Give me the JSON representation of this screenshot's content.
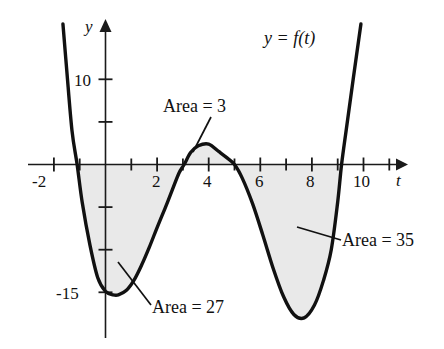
{
  "figure": {
    "function_label": "y = f(t)",
    "axis_labels": {
      "x": "t",
      "y": "y"
    },
    "colors": {
      "curve": "#111111",
      "axis": "#1a1a1a",
      "shade_fill": "#e9e9e9",
      "background": "#ffffff",
      "text": "#111111"
    }
  },
  "annotations": [
    {
      "id": "area-3",
      "label": "Area = 3",
      "value": 3,
      "interval": [
        3.05,
        5.0
      ],
      "sign": "positive"
    },
    {
      "id": "area-27",
      "label": "Area = 27",
      "value": 27,
      "interval": [
        -1.1,
        3.05
      ],
      "sign": "negative"
    },
    {
      "id": "area-35",
      "label": "Area = 35",
      "value": 35,
      "interval": [
        5.0,
        9.15
      ],
      "sign": "negative"
    }
  ],
  "chart_data": {
    "type": "line",
    "title": "y = f(t)",
    "xlabel": "t",
    "ylabel": "y",
    "xlim": [
      -2.9,
      11.5
    ],
    "ylim": [
      -20.5,
      16.5
    ],
    "grid": false,
    "legend": null,
    "x_ticks": [
      -2,
      -1,
      1,
      2,
      3,
      4,
      5,
      6,
      7,
      8,
      9,
      10,
      11
    ],
    "x_tick_labels": [
      "-2",
      "",
      "",
      "2",
      "",
      "4",
      "",
      "6",
      "",
      "8",
      "",
      "10",
      ""
    ],
    "y_ticks": [
      10,
      5,
      -5,
      -10,
      -15
    ],
    "y_tick_labels": [
      "10",
      "",
      "",
      "",
      "-15"
    ],
    "zeros": [
      -1.1,
      3.05,
      5.0,
      9.15
    ],
    "extrema": [
      {
        "t": 0.5,
        "y": -15.3,
        "kind": "local-minimum"
      },
      {
        "t": 4.0,
        "y": 2.4,
        "kind": "local-maximum"
      },
      {
        "t": 7.7,
        "y": -18.0,
        "kind": "local-minimum"
      }
    ],
    "series": [
      {
        "name": "f(t)",
        "x": [
          -1.65,
          -1.5,
          -1.3,
          -1.1,
          -0.9,
          -0.6,
          -0.3,
          0.0,
          0.3,
          0.5,
          0.8,
          1.1,
          1.4,
          1.7,
          2.0,
          2.3,
          2.6,
          2.85,
          3.05,
          3.3,
          3.6,
          4.0,
          4.4,
          4.7,
          5.0,
          5.3,
          5.7,
          6.1,
          6.5,
          6.9,
          7.3,
          7.7,
          8.1,
          8.45,
          8.75,
          9.0,
          9.15,
          9.35,
          9.6,
          9.9
        ],
        "y": [
          16.5,
          11.0,
          4.0,
          0.0,
          -4.5,
          -9.5,
          -13.3,
          -14.9,
          -15.3,
          -15.3,
          -14.8,
          -13.6,
          -11.8,
          -9.7,
          -7.4,
          -5.2,
          -2.9,
          -1.0,
          0.0,
          1.4,
          2.2,
          2.4,
          1.5,
          0.8,
          0.0,
          -1.6,
          -4.6,
          -8.3,
          -12.2,
          -15.5,
          -17.6,
          -18.0,
          -16.5,
          -13.6,
          -10.0,
          -4.4,
          0.0,
          4.5,
          10.0,
          16.5
        ]
      }
    ],
    "shaded_regions": [
      {
        "name": "Area = 27",
        "from": -1.1,
        "to": 3.05,
        "value": 27,
        "side": "below-axis"
      },
      {
        "name": "Area = 3",
        "from": 3.05,
        "to": 5.0,
        "value": 3,
        "side": "above-axis"
      },
      {
        "name": "Area = 35",
        "from": 5.0,
        "to": 9.15,
        "value": 35,
        "side": "below-axis"
      }
    ]
  }
}
